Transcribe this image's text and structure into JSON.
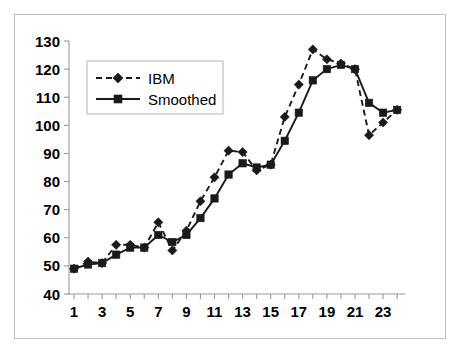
{
  "chart_data": {
    "type": "line",
    "title": "",
    "subtitle": "",
    "xlabel": "",
    "ylabel": "",
    "xlim": [
      0.4,
      24.6
    ],
    "ylim": [
      40,
      130
    ],
    "ytick_labels": [
      "130",
      "120",
      "110",
      "100",
      "90",
      "80",
      "70",
      "60",
      "50",
      "40"
    ],
    "ytick_values": [
      130,
      120,
      110,
      100,
      90,
      80,
      70,
      60,
      50,
      40
    ],
    "xtick_labels": [
      "1",
      "3",
      "5",
      "7",
      "9",
      "11",
      "13",
      "15",
      "17",
      "19",
      "21",
      "23"
    ],
    "xtick_values": [
      1,
      3,
      5,
      7,
      9,
      11,
      13,
      15,
      17,
      19,
      21,
      23
    ],
    "x": [
      1,
      2,
      3,
      4,
      5,
      6,
      7,
      8,
      9,
      10,
      11,
      12,
      13,
      14,
      15,
      16,
      17,
      18,
      19,
      20,
      21,
      22,
      23,
      24
    ],
    "grid": false,
    "legend_position": "upper-left",
    "series": [
      {
        "name": "IBM",
        "marker": "diamond",
        "linestyle": "dashed",
        "color": "#1a1a1a",
        "values": [
          49,
          51.5,
          51,
          57.5,
          57.5,
          56.5,
          65.5,
          55.5,
          62.5,
          73,
          81.5,
          91,
          90.5,
          84,
          86,
          103,
          114.5,
          127,
          123.5,
          122,
          120,
          96.5,
          101,
          105.5
        ]
      },
      {
        "name": "Smoothed",
        "marker": "square",
        "linestyle": "solid",
        "color": "#1a1a1a",
        "values": [
          49,
          50.5,
          51,
          54,
          56.5,
          56.5,
          61,
          58.5,
          61,
          67,
          74,
          82.5,
          86.5,
          85,
          86,
          94.5,
          104.5,
          116,
          120,
          121.5,
          120,
          108,
          104.5,
          105.5
        ]
      }
    ]
  },
  "legend": {
    "entries": [
      {
        "label": "IBM"
      },
      {
        "label": "Smoothed"
      }
    ]
  }
}
